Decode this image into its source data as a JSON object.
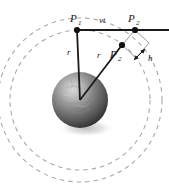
{
  "figure": {
    "kind": "geometric-physics-diagram",
    "background_color": "#ffffff",
    "line_color": "#1a1a1a",
    "dashed_circle_color": "#a3a3a3",
    "thin_line_color": "#8c8c8c",
    "sphere_color_light": "#b9b9b9",
    "sphere_color_dark": "#3a3a3a",
    "shadow_color": "#c9c9c9"
  },
  "labels": {
    "p1": "P",
    "p1_sub": "1",
    "p2": "P",
    "p2_sub": "2",
    "p2prime": "P",
    "p2prime_sub": "2",
    "p2prime_mark": "′",
    "vt": "vt",
    "r_vertical": "r",
    "r_diagonal": "r",
    "h": "h"
  },
  "points": {
    "center": {
      "x": 80,
      "y": 100,
      "name": "sphere-center"
    },
    "p1": {
      "x": 77,
      "y": 30
    },
    "p2": {
      "x": 135,
      "y": 30
    },
    "p2prime": {
      "x": 122,
      "y": 45
    },
    "h_arrow_tip": {
      "x": 146,
      "y": 50
    },
    "h_arrow_tail": {
      "x": 136,
      "y": 58
    }
  },
  "geometry": {
    "inner_dashed_circle": {
      "cx": 80,
      "cy": 100,
      "r": 70
    },
    "outer_dashed_circle": {
      "cx": 80,
      "cy": 100,
      "r": 82
    },
    "sphere": {
      "cx": 80,
      "cy": 100,
      "r": 28
    },
    "horizontal_line_y": 30,
    "horizontal_line_x_end": 169
  }
}
